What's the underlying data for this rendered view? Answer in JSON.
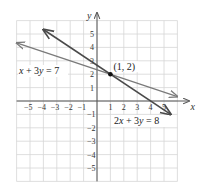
{
  "chart_data": {
    "type": "line",
    "title": "",
    "xlabel": "x",
    "ylabel": "y",
    "xlim": [
      -6,
      6
    ],
    "ylim": [
      -6,
      6
    ],
    "grid": true,
    "x_ticks": [
      "-5",
      "-4",
      "-3",
      "-2",
      "-1",
      "1",
      "2",
      "3",
      "4",
      "5"
    ],
    "y_ticks": [
      "5",
      "4",
      "3",
      "2",
      "1",
      "-1",
      "-2",
      "-3",
      "-4",
      "-5"
    ],
    "series": [
      {
        "name": "x + 3y = 7",
        "equation": "x + 3y = 7",
        "slope": -0.3333,
        "intercept": 2.3333,
        "color": "#7a7a7a",
        "x": [
          -6,
          6
        ],
        "y": [
          4.333,
          0.333
        ]
      },
      {
        "name": "2x + 3y = 8",
        "equation": "2x + 3y = 8",
        "slope": -0.6667,
        "intercept": 2.6667,
        "color": "#4a4a4a",
        "x": [
          -4,
          5.5
        ],
        "y": [
          5.333,
          -1.0
        ]
      }
    ],
    "annotations": [
      {
        "text": "(1, 2)",
        "x": 1,
        "y": 2,
        "type": "intersection-point"
      }
    ]
  },
  "labels": {
    "x_axis": "x",
    "y_axis": "y",
    "point": "(1, 2)",
    "eq1": "x + 3y = 7",
    "eq2": "2x + 3y = 8"
  }
}
